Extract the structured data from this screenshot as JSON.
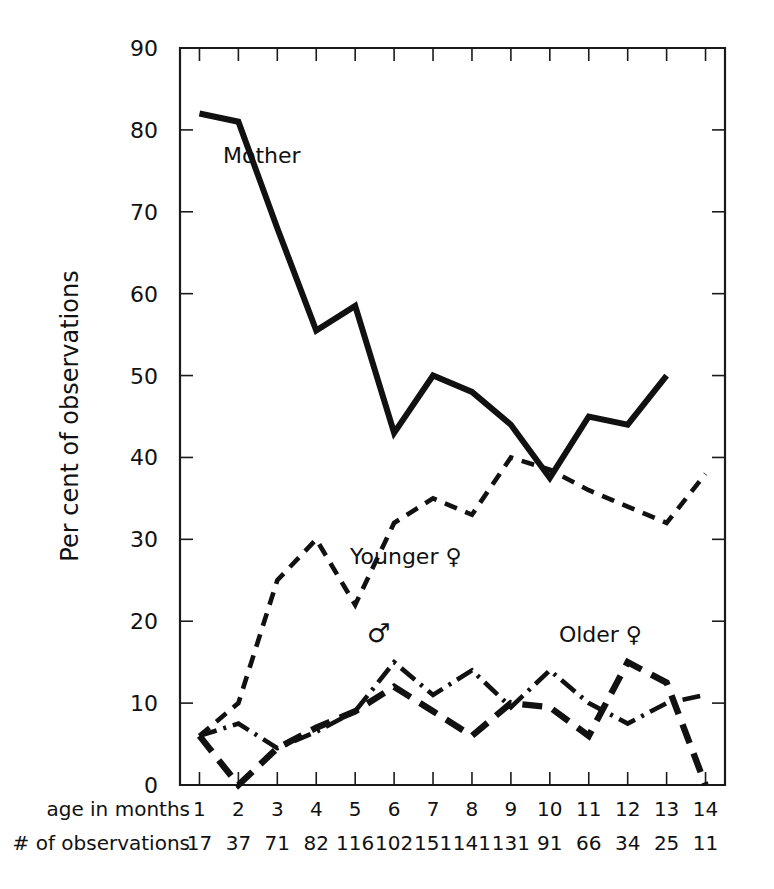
{
  "chart_data": {
    "type": "line",
    "title": "",
    "xlabel": "age in months",
    "ylabel": "Per cent of observations",
    "xlim": [
      0.5,
      14.5
    ],
    "ylim": [
      0,
      90
    ],
    "grid": false,
    "legend_position": "inline-annotations",
    "x_tick_labels": [
      "1",
      "2",
      "3",
      "4",
      "5",
      "6",
      "7",
      "8",
      "9",
      "10",
      "11",
      "12",
      "13",
      "14"
    ],
    "y_tick_labels": [
      "0",
      "10",
      "20",
      "30",
      "40",
      "50",
      "60",
      "70",
      "80",
      "90"
    ],
    "x": [
      1,
      2,
      3,
      4,
      5,
      6,
      7,
      8,
      9,
      10,
      11,
      12,
      13,
      14
    ],
    "observations_row_label": "# of observations",
    "observations": [
      "17",
      "37",
      "71",
      "82",
      "116",
      "102",
      "151",
      "141",
      "131",
      "91",
      "66",
      "34",
      "25",
      "11"
    ],
    "series": [
      {
        "name": "Mother",
        "style": "solid",
        "label": "Mother",
        "x": [
          1,
          2,
          3,
          4,
          5,
          6,
          7,
          8,
          9,
          10,
          11,
          12,
          13
        ],
        "values": [
          82,
          81,
          68,
          55.5,
          58.5,
          43,
          50,
          48,
          44,
          37.5,
          45,
          44,
          50
        ]
      },
      {
        "name": "Younger female",
        "style": "dashed",
        "label": "Younger ♀",
        "x": [
          1,
          2,
          3,
          4,
          5,
          6,
          7,
          8,
          9,
          10,
          11,
          12,
          13,
          14
        ],
        "values": [
          6,
          10,
          25,
          30,
          22,
          32,
          35,
          33,
          40,
          38.5,
          36,
          34,
          32,
          38
        ]
      },
      {
        "name": "Male",
        "style": "dash-dot",
        "label": "♂",
        "x": [
          1,
          2,
          3,
          4,
          5,
          6,
          7,
          8,
          9,
          10,
          11,
          12,
          13,
          14
        ],
        "values": [
          6,
          7.5,
          4.5,
          6.5,
          9,
          15,
          11,
          14,
          9.5,
          14,
          10,
          7.5,
          10,
          11
        ]
      },
      {
        "name": "Older female",
        "style": "heavy-dashed",
        "label": "Older ♀",
        "x": [
          1,
          2,
          3,
          4,
          5,
          6,
          7,
          8,
          9,
          10,
          11,
          12,
          13,
          14
        ],
        "values": [
          6,
          0,
          4.5,
          7,
          9,
          12,
          9,
          6,
          10,
          9.5,
          6,
          15,
          12.5,
          0
        ]
      }
    ],
    "annotations": [
      {
        "text": "Mother",
        "x": 2.6,
        "y": 76
      },
      {
        "text": "Younger ♀",
        "x": 6.3,
        "y": 27
      },
      {
        "text": "♂",
        "x": 5.6,
        "y": 17.5
      },
      {
        "text": "Older ♀",
        "x": 11.3,
        "y": 17.5
      }
    ]
  }
}
